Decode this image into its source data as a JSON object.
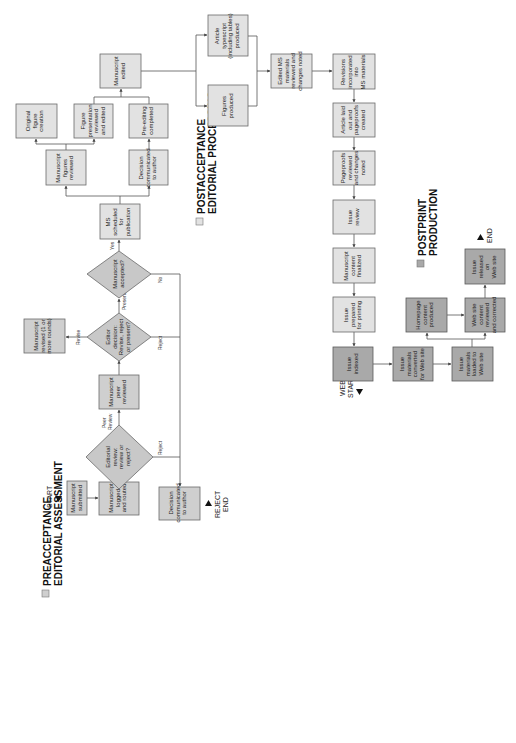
{
  "legend": {
    "preacceptance": {
      "line1": "PREACCEPTANCE",
      "line2": "EDITORIAL ASSESSMENT",
      "color": "#cfcfcf"
    },
    "postacceptance": {
      "line1": "POSTACCEPTANCE",
      "line2": "EDITORIAL PROCESSING",
      "color": "#e2e2e2"
    },
    "postprint": {
      "line1": "POSTPRINT",
      "line2": "PRODUCTION",
      "color": "#a9a9a9"
    }
  },
  "terminals": {
    "start": "START",
    "reject_end_1": "REJECT",
    "reject_end_2": "END",
    "web_start_1": "WEB",
    "web_start_2": "START",
    "end": "END"
  },
  "edge_labels": {
    "peer_review_1": "Peer",
    "peer_review_2": "Review",
    "reject_1": "Reject",
    "revise": "Revise",
    "reject_2": "Reject",
    "present": "Present",
    "no": "No",
    "yes": "Yes"
  },
  "nodes": {
    "ms_submitted": [
      "Manuscript",
      "submitted"
    ],
    "ms_logged": [
      "Manuscript",
      "logged",
      "and routed"
    ],
    "decision_reject": [
      "Decision",
      "communicated",
      "to author"
    ],
    "editorial_review": [
      "Editorial",
      "review:",
      "review or",
      "reject?"
    ],
    "peer_reviewed": [
      "Manuscript",
      "peer",
      "reviewed"
    ],
    "editor_decision": [
      "Editor",
      "decision:",
      "Revise, reject",
      "or present?"
    ],
    "ms_revised": [
      "Manuscript",
      "revised (1 or",
      "more rounds)"
    ],
    "ms_accepted": [
      "Manuscript",
      "accepted?"
    ],
    "ms_scheduled": [
      "MS",
      "scheduled",
      "for",
      "publication"
    ],
    "figures_reviewed": [
      "Manuscript",
      "figures",
      "reviewed"
    ],
    "decision_post": [
      "Decision",
      "communicated",
      "to author"
    ],
    "original_figure": [
      "Original",
      "figure",
      "creation"
    ],
    "figure_presentation": [
      "Figure",
      "presentation",
      "reviewed",
      "and edited"
    ],
    "pre_editing": [
      "Pre-editing",
      "completed"
    ],
    "ms_edited": [
      "Manuscript",
      "edited"
    ],
    "article_typescript": [
      "Article",
      "typescript",
      "(including tables)",
      "produced"
    ],
    "figures_produced": [
      "Figures",
      "produced"
    ],
    "edited_ms_materials": [
      "Edited MS",
      "materials",
      "reviewed and",
      "changes noted"
    ],
    "revisions_incorporated": [
      "Revisions",
      "incorporated",
      "into",
      "MS materials"
    ],
    "article_laid_out": [
      "Article laid",
      "out and",
      "pageproofs",
      "created"
    ],
    "pageproofs_reviewed": [
      "Pageproofs",
      "reviewed",
      "and changes",
      "noted"
    ],
    "issue_review": [
      "Issue",
      "review"
    ],
    "content_finalized": [
      "Manuscript",
      "content",
      "finalized"
    ],
    "issue_prepared": [
      "Issue",
      "prepared",
      "for printing"
    ],
    "issue_indexed": [
      "Issue",
      "indexed"
    ],
    "materials_converted": [
      "Issue",
      "materials",
      "converted",
      "for Web site"
    ],
    "materials_loaded": [
      "Issue",
      "materials",
      "loaded to",
      "Web site"
    ],
    "homepage_content": [
      "Homepage",
      "content",
      "produced"
    ],
    "website_reviewed": [
      "Web site",
      "content",
      "reviewed",
      "and corrected"
    ],
    "issue_released": [
      "Issue",
      "released",
      "on",
      "Web site"
    ]
  }
}
